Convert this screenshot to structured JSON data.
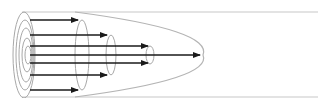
{
  "diagram": {
    "title": "Laminar flow velocity profile in a pipe",
    "colors": {
      "background": "#ffffff",
      "tube_outline": "#c8c8c8",
      "shell_outline": "#a8a8a8",
      "arrow": "#1a1a1a",
      "parabola": "#b4b4b4"
    },
    "tube": {
      "top_y": 12,
      "bottom_y": 97,
      "left_x": 22,
      "right_x": 318
    },
    "center_y": 55,
    "front_face_ellipses": [
      {
        "cx": 24,
        "rx": 11,
        "ry": 43
      },
      {
        "cx": 25,
        "rx": 9,
        "ry": 35
      },
      {
        "cx": 26,
        "rx": 7,
        "ry": 27
      },
      {
        "cx": 27,
        "rx": 5,
        "ry": 17
      },
      {
        "cx": 28,
        "rx": 3,
        "ry": 9
      }
    ],
    "shell_ends": [
      {
        "cx": 82,
        "rx": 7,
        "ry": 35
      },
      {
        "cx": 111,
        "rx": 5,
        "ry": 20
      },
      {
        "cx": 150,
        "rx": 4,
        "ry": 9
      }
    ],
    "arrows": [
      {
        "label": "outer layer top",
        "y": 20,
        "x1": 30,
        "x2": 78
      },
      {
        "label": "outer layer bottom",
        "y": 90,
        "x1": 30,
        "x2": 78
      },
      {
        "label": "second layer top",
        "y": 35,
        "x1": 30,
        "x2": 107
      },
      {
        "label": "second layer bottom",
        "y": 75,
        "x1": 30,
        "x2": 107
      },
      {
        "label": "third layer top",
        "y": 46,
        "x1": 30,
        "x2": 148
      },
      {
        "label": "third layer bottom",
        "y": 63,
        "x1": 30,
        "x2": 148
      },
      {
        "label": "center line",
        "y": 55,
        "x1": 30,
        "x2": 200
      }
    ],
    "parabola": {
      "start_x": 75,
      "top_y": 12,
      "bottom_y": 97,
      "nose_x": 203
    }
  }
}
